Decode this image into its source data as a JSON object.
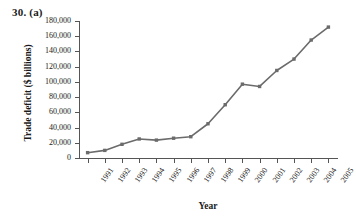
{
  "figure": {
    "number_label": "30. (a)"
  },
  "chart_data": {
    "type": "line",
    "title": "30. (a)",
    "xlabel": "Year",
    "ylabel": "Trade deficit ($ billions)",
    "categories": [
      "1991",
      "1992",
      "1993",
      "1994",
      "1995",
      "1996",
      "1997",
      "1998",
      "1999",
      "2000",
      "2001",
      "2002",
      "2003",
      "2004",
      "2005"
    ],
    "values": [
      7000,
      10000,
      18000,
      25000,
      23500,
      26000,
      28000,
      45000,
      70000,
      97000,
      94000,
      115000,
      130000,
      155000,
      172000
    ],
    "ylim": [
      0,
      180000
    ],
    "ytick_values": [
      0,
      20000,
      40000,
      60000,
      80000,
      100000,
      120000,
      140000,
      160000,
      180000
    ],
    "ytick_labels": [
      "0",
      "20,000",
      "40,000",
      "60,000",
      "80,000",
      "100,000",
      "120,000",
      "140,000",
      "160,000",
      "180,000"
    ],
    "grid": false,
    "legend": false,
    "legend_position": "none",
    "series_color": "#6b6b6b",
    "marker": "square",
    "axis_color": "#555555"
  }
}
